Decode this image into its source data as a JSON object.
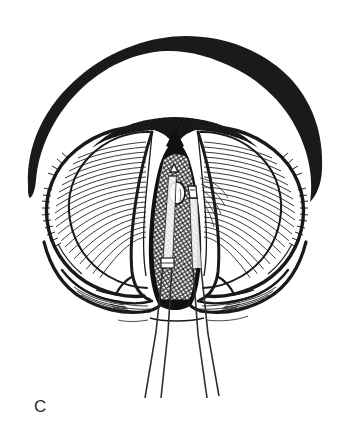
{
  "figure": {
    "kind": "anatomical-line-illustration",
    "panel_label": "C",
    "background_color": "#ffffff",
    "ink_color": "#1a1a1a",
    "hatch_color": "#222222",
    "instrument_color": "#3a3a3a",
    "title": "",
    "caption": "",
    "parts": [
      {
        "name": "outer-rim-arch",
        "label": ""
      },
      {
        "name": "upper-hatched-band",
        "label": ""
      },
      {
        "name": "left-lobe",
        "label": ""
      },
      {
        "name": "right-lobe",
        "label": ""
      },
      {
        "name": "left-inner-fold",
        "label": ""
      },
      {
        "name": "right-inner-fold",
        "label": ""
      },
      {
        "name": "central-aperture",
        "label": ""
      },
      {
        "name": "crosshatched-tissue",
        "label": ""
      },
      {
        "name": "pale-nodule",
        "label": ""
      },
      {
        "name": "lower-left-fold",
        "label": ""
      },
      {
        "name": "lower-right-fold",
        "label": ""
      },
      {
        "name": "instrument-shaft-left",
        "label": ""
      },
      {
        "name": "instrument-shaft-right",
        "label": ""
      }
    ]
  }
}
